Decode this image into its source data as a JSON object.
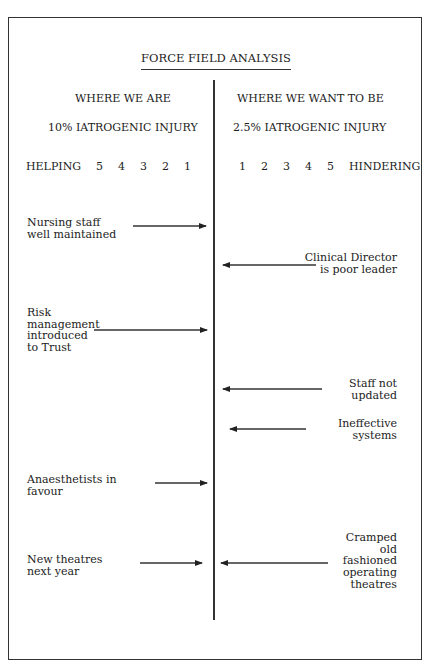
{
  "title": "FORCE FIELD ANALYSIS",
  "left_column": {
    "heading": "WHERE WE ARE",
    "state": "10% IATROGENIC INJURY",
    "scale_label": "HELPING  5  4  3  2  1"
  },
  "right_column": {
    "heading": "WHERE WE WANT TO BE",
    "state": "2.5% IATROGENIC INJURY",
    "scale_label": "1  2  3  4  5  HINDERING"
  },
  "helping_forces": [
    {
      "lines": [
        "Nursing staff",
        "well maintained"
      ]
    },
    {
      "lines": [
        "Risk",
        "management",
        "introduced",
        "to Trust"
      ]
    },
    {
      "lines": [
        "Anaesthetists in",
        "favour"
      ]
    },
    {
      "lines": [
        "New theatres",
        "next year"
      ]
    }
  ],
  "hindering_forces": [
    {
      "lines": [
        "Clinical Director",
        "is poor leader"
      ]
    },
    {
      "lines": [
        "Staff not",
        "updated"
      ]
    },
    {
      "lines": [
        "Ineffective",
        "systems"
      ]
    },
    {
      "lines": [
        "Cramped",
        "old",
        "fashioned",
        "operating",
        "theatres"
      ]
    }
  ],
  "colors": {
    "line": "#333333",
    "text": "#222222",
    "background": "#ffffff"
  }
}
